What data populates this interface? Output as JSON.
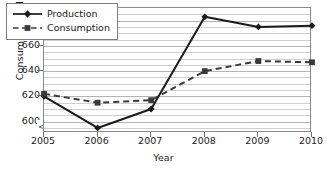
{
  "chart_data": {
    "type": "line",
    "title": "",
    "xlabel": "Year",
    "ylabel": "Consumption (MMT)",
    "categories": [
      "2005",
      "2006",
      "2007",
      "2008",
      "2009",
      "2010"
    ],
    "x": [
      2005,
      2006,
      2007,
      2008,
      2009,
      2010
    ],
    "series": [
      {
        "name": "Production",
        "values": [
          620,
          595,
          610,
          683,
          675,
          676
        ],
        "line_style": "solid",
        "marker": "diamond",
        "color": "#1a1a1a"
      },
      {
        "name": "Consumption",
        "values": [
          622,
          615,
          617,
          640,
          648,
          647
        ],
        "line_style": "dashed",
        "marker": "square",
        "color": "#3a3a3a"
      }
    ],
    "ylim": [
      591,
      690
    ],
    "xlim": [
      2005,
      2010
    ],
    "ytick_labels": [
      "600",
      "620",
      "640",
      "660",
      "680"
    ],
    "yticks": [
      600,
      620,
      640,
      660,
      680
    ],
    "yminor_step": 5,
    "grid": true,
    "grid_axis": "y",
    "legend_position": "top-left-inside",
    "axis_break": true,
    "axis_break_axis": "y",
    "gridline_color": "#cfcfcf",
    "frame_color": "#8a8a8a",
    "background": "#ffffff"
  },
  "legend": {
    "entries": [
      {
        "label": "Production"
      },
      {
        "label": "Consumption"
      }
    ]
  },
  "axes": {
    "y_title": "Consumption (MMT)",
    "x_title": "Year"
  }
}
